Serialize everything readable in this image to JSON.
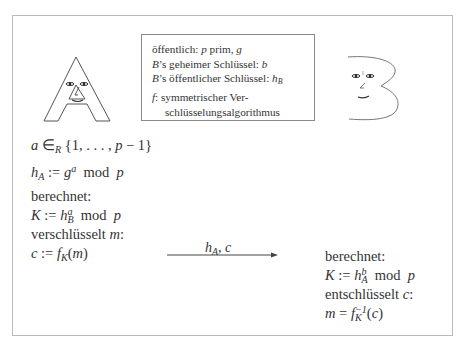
{
  "info_box": {
    "line1_prefix": "öffentlich: ",
    "line1_p": "p",
    "line1_mid": " prim, ",
    "line1_g": "g",
    "line2_B": "B",
    "line2_text": "’s geheimer Schlüssel: ",
    "line2_b": "b",
    "line3_B": "B",
    "line3_text": "’s öffentlicher Schlüssel: ",
    "line3_h": "h",
    "line3_sub": "B",
    "line4_f": "f",
    "line4_text": ": symmetrischer Ver-",
    "line5_text": "schlüsselungsalgorithmus"
  },
  "alice": {
    "figure": "letter-a-face",
    "l1_a": "a",
    "l1_in": " ∈",
    "l1_sub": "R",
    "l1_set": " {1, . . . , ",
    "l1_p": "p",
    "l1_end": " − 1}",
    "l2_h": "h",
    "l2_sub": "A",
    "l2_assign": " := ",
    "l2_g": "g",
    "l2_sup": "a",
    "l2_mod": "  mod  ",
    "l2_p": "p",
    "l3": "berechnet:",
    "l4_K": "K",
    "l4_assign": " := ",
    "l4_h": "h",
    "l4_sup": "a",
    "l4_sub": "B",
    "l4_mod": "  mod  ",
    "l4_p": "p",
    "l5_text": "verschlüsselt ",
    "l5_m": "m",
    "l5_colon": ":",
    "l6_c": "c",
    "l6_assign": " := ",
    "l6_f": "f",
    "l6_sub": "K",
    "l6_open": "(",
    "l6_m": "m",
    "l6_close": ")"
  },
  "bob": {
    "figure": "letter-b-face",
    "l1": "berechnet:",
    "l2_K": "K",
    "l2_assign": " := ",
    "l2_h": "h",
    "l2_sup": "b",
    "l2_sub": "A",
    "l2_mod": "  mod  ",
    "l2_p": "p",
    "l3_text": "entschlüsselt ",
    "l3_c": "c",
    "l3_colon": ":",
    "l4_m": "m",
    "l4_eq": " = ",
    "l4_f": "f",
    "l4_sup": "−1",
    "l4_sub": "K",
    "l4_open": "(",
    "l4_c": "c",
    "l4_close": ")"
  },
  "message": {
    "label_h": "h",
    "label_sub": "A",
    "label_rest": ", c",
    "direction": "A-to-B"
  },
  "colors": {
    "frame": "#b8b8b8",
    "ink": "#333333"
  }
}
